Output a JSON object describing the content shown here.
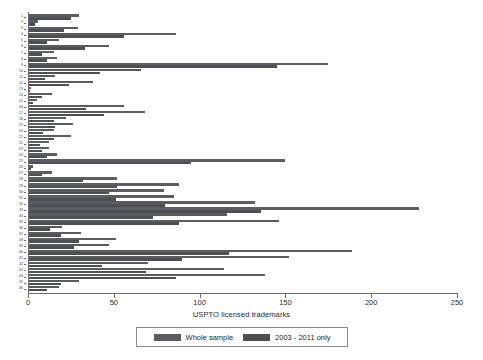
{
  "chart_data": {
    "type": "bar",
    "orientation": "horizontal",
    "title": "",
    "xlabel": "USPTO licensed trademarks",
    "ylabel": "",
    "xlim": [
      0,
      250
    ],
    "xticks": [
      0,
      50,
      100,
      150,
      200,
      250
    ],
    "grid": false,
    "legend_position": "bottom",
    "categories": [
      "1",
      "2",
      "3",
      "4",
      "5",
      "6",
      "7",
      "8",
      "9",
      "10",
      "11",
      "12",
      "13",
      "14",
      "15",
      "16",
      "17",
      "18",
      "19",
      "20",
      "21",
      "22",
      "23",
      "24",
      "25",
      "26",
      "27",
      "28",
      "29",
      "30",
      "31",
      "32",
      "33",
      "34",
      "35",
      "36",
      "37",
      "38",
      "39",
      "40",
      "41",
      "42",
      "43",
      "44",
      "45",
      "46"
    ],
    "series": [
      {
        "name": "Whole sample",
        "color": "#5b5c60",
        "values": [
          30,
          6,
          29,
          86,
          18,
          47,
          15,
          17,
          175,
          66,
          16,
          38,
          2,
          14,
          5,
          56,
          68,
          22,
          26,
          15,
          25,
          12,
          12,
          17,
          150,
          3,
          14,
          52,
          88,
          79,
          85,
          132,
          228,
          116,
          146,
          20,
          31,
          51,
          47,
          189,
          152,
          70,
          114,
          138,
          30,
          18
        ]
      },
      {
        "name": "2003 - 2011 only",
        "color": "#4e4f53",
        "values": [
          25,
          4,
          21,
          56,
          11,
          33,
          8,
          11,
          145,
          42,
          10,
          24,
          1,
          8,
          3,
          34,
          44,
          15,
          16,
          9,
          15,
          7,
          8,
          11,
          95,
          2,
          8,
          32,
          52,
          47,
          51,
          80,
          136,
          73,
          88,
          13,
          19,
          30,
          27,
          117,
          90,
          43,
          69,
          86,
          19,
          11
        ]
      }
    ]
  },
  "axis": {
    "x_tick_labels": [
      "0",
      "50",
      "100",
      "150",
      "200",
      "250"
    ],
    "x_title": "USPTO licensed trademarks"
  },
  "legend": {
    "items": [
      {
        "label": "Whole sample",
        "swatch": "legend-swatch-whole-sample"
      },
      {
        "label": "2003 - 2011 only",
        "swatch": "legend-swatch-recent"
      }
    ]
  }
}
